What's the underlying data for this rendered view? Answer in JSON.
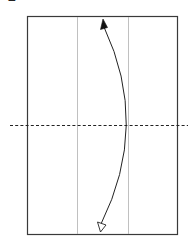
{
  "step": {
    "number": "2"
  },
  "diagram": {
    "type": "origami-fold-step",
    "paper": {
      "x": 27,
      "y": 16,
      "width": 150,
      "height": 218,
      "border_color": "#3a3a3a",
      "fill": "#ffffff"
    },
    "existing_creases": [
      {
        "x": 77,
        "color": "#b0b0b0"
      },
      {
        "x": 128,
        "color": "#b0b0b0"
      }
    ],
    "fold_line": {
      "style": "dashed",
      "kind": "valley-fold",
      "y": 125,
      "x1": 10,
      "x2": 188,
      "color": "#222222"
    },
    "arrow": {
      "kind": "fold-arrow",
      "from": "bottom",
      "to": "top",
      "start_head": "hollow",
      "end_head": "filled",
      "color": "#222222"
    }
  }
}
